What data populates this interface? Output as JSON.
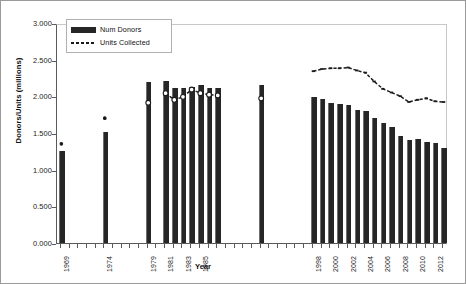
{
  "chart_data": {
    "type": "bar",
    "title": "",
    "xlabel": "Year",
    "ylabel": "Donors/Units (millions)",
    "ylim": [
      0.0,
      3.0
    ],
    "ytick_labels": [
      "0.000",
      "0.500",
      "1.000",
      "1.500",
      "2.000",
      "2.500",
      "3.000"
    ],
    "ytick_values": [
      0.0,
      0.5,
      1.0,
      1.5,
      2.0,
      2.5,
      3.0
    ],
    "grid": false,
    "legend_position": "upper-left-inside",
    "categories": [
      "1969",
      "1974",
      "1979",
      "1981",
      "1982",
      "1983",
      "1984",
      "1985",
      "1986",
      "1987",
      "1992",
      "1998",
      "1999",
      "2000",
      "2001",
      "2002",
      "2003",
      "2004",
      "2005",
      "2006",
      "2007",
      "2008",
      "2009",
      "2010",
      "2011",
      "2012",
      "2013"
    ],
    "xtick_labels_shown": [
      "1969",
      "1974",
      "1979",
      "1981",
      "1983",
      "1985",
      "1998",
      "2000",
      "2002",
      "2004",
      "2006",
      "2008",
      "2010",
      "2012"
    ],
    "series": [
      {
        "name": "Num Donors",
        "type": "bar",
        "color": "#262626",
        "values": [
          1.25,
          1.52,
          2.2,
          2.21,
          2.12,
          2.11,
          2.13,
          2.16,
          2.12,
          2.12,
          2.15,
          1.99,
          1.97,
          1.91,
          1.9,
          1.88,
          1.82,
          1.8,
          1.71,
          1.64,
          1.58,
          1.46,
          1.41,
          1.42,
          1.38,
          1.36,
          1.29
        ]
      },
      {
        "name": "Units Collected",
        "type": "line",
        "color": "#1a1a1a",
        "marker": "circle-open",
        "values": [
          1.38,
          1.73,
          1.94,
          2.07,
          1.98,
          2.02,
          2.12,
          2.07,
          2.05,
          2.04,
          2.0,
          2.37,
          2.4,
          2.41,
          2.41,
          2.42,
          2.38,
          2.35,
          2.23,
          2.13,
          2.08,
          2.03,
          1.95,
          1.98,
          2.0,
          1.96,
          1.95
        ]
      }
    ]
  },
  "legend": {
    "items": [
      {
        "label": "Num Donors",
        "marker": "filled-bar-swatch"
      },
      {
        "label": "Units Collected",
        "marker": "dashed-line-swatch"
      }
    ]
  },
  "axes": {
    "y_title": "Donors/Units (millions)",
    "x_title": "Year"
  }
}
